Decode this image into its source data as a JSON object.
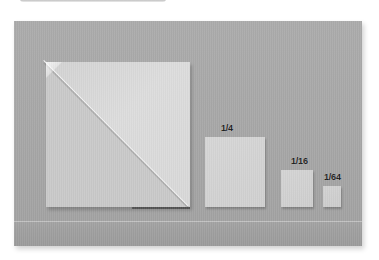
{
  "figure": {
    "type": "photograph",
    "background_color": "#a8a8a8",
    "paper_color": "#d6d6d6",
    "label_color": "#1e1e1e"
  },
  "top_crop_bar": {
    "name": "cropped-bar",
    "color": "#9a9a9a"
  },
  "papers": [
    {
      "id": "full",
      "label": "",
      "fraction": "1",
      "folded": true,
      "fold": "diagonal-top-left-to-bottom-right"
    },
    {
      "id": "quarter",
      "label": "1/4",
      "fraction": "1/4",
      "folded": false
    },
    {
      "id": "sixteenth",
      "label": "1/16",
      "fraction": "1/16",
      "folded": false
    },
    {
      "id": "sixtyfourth",
      "label": "1/64",
      "fraction": "1/64",
      "folded": false
    }
  ],
  "labels": {
    "quarter": "1/4",
    "sixteenth": "1/16",
    "sixtyfourth": "1/64"
  }
}
